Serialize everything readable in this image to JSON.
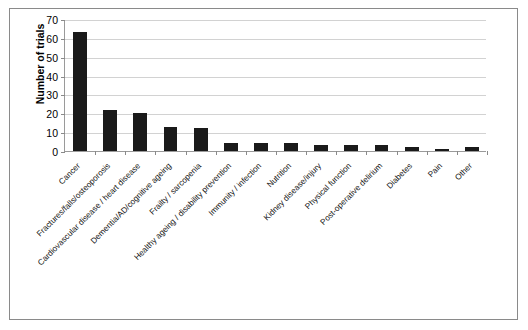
{
  "chart_data": {
    "type": "bar",
    "title": "",
    "subtitle": "",
    "xlabel": "",
    "ylabel": "Number of trials",
    "ylim": [
      0,
      70
    ],
    "ytick_step": 10,
    "yticks": [
      70,
      60,
      50,
      40,
      30,
      20,
      10,
      0
    ],
    "grid": true,
    "legend": false,
    "bar_color": "#1a1a1a",
    "categories": [
      "Cancer",
      "Fractures/falls/osteoporosis",
      "Cardiovascular disease / heart disease",
      "Dementia/AD/cognitive ageing",
      "Frailty / sarcopenia",
      "Healthy ageing / disability prevention",
      "Immunity / infection",
      "Nutrition",
      "Kidney disease/injury",
      "Physical function",
      "Post-operative delirium",
      "Diabetes",
      "Pain",
      "Other"
    ],
    "values": [
      63,
      22,
      20,
      13,
      12,
      4,
      4,
      4,
      3,
      3,
      3,
      2,
      1,
      2
    ]
  },
  "axes": {
    "y_title": "Number of trials"
  }
}
